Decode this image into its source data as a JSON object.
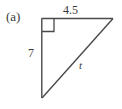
{
  "figure": {
    "part_label": "(a)",
    "shape": "right-triangle",
    "stroke_color": "#4a4a4a",
    "background_color": "#ffffff",
    "right_angle_marker": true,
    "labels": {
      "top_side": "4.5",
      "left_side": "7",
      "hypotenuse": "t"
    },
    "geometry": {
      "top_left_vertex": "41,18",
      "top_right_vertex": "113,18",
      "bottom_left_vertex": "42,98",
      "right_angle_square": "41,18 54,18 54,31 41,31"
    }
  }
}
